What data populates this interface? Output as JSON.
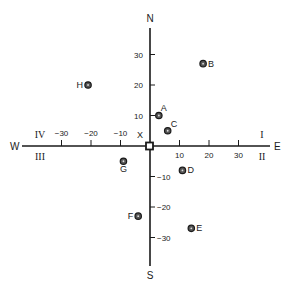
{
  "chart_data": {
    "type": "scatter",
    "title": "",
    "xlabel": "",
    "ylabel": "",
    "xlim": [
      -40,
      40
    ],
    "ylim": [
      -40,
      40
    ],
    "grid": false,
    "origin_label": "X",
    "directions": {
      "north": "N",
      "south": "S",
      "east": "E",
      "west": "W"
    },
    "quadrants": [
      {
        "label": "I",
        "position": "upper-right"
      },
      {
        "label": "II",
        "position": "lower-right"
      },
      {
        "label": "III",
        "position": "lower-left"
      },
      {
        "label": "IV",
        "position": "upper-left"
      }
    ],
    "x_ticks": [
      -30,
      -20,
      -10,
      10,
      20,
      30
    ],
    "y_ticks": [
      30,
      20,
      10,
      -10,
      -20,
      -30
    ],
    "x_tick_labels": [
      "−30",
      "−20",
      "−10",
      "10",
      "20",
      "30"
    ],
    "y_tick_labels": [
      "30",
      "20",
      "10",
      "−10",
      "−20",
      "−30"
    ],
    "points": [
      {
        "label": "A",
        "x": 3,
        "y": 10
      },
      {
        "label": "B",
        "x": 18,
        "y": 27
      },
      {
        "label": "C",
        "x": 6,
        "y": 5
      },
      {
        "label": "D",
        "x": 11,
        "y": -8
      },
      {
        "label": "E",
        "x": 14,
        "y": -27
      },
      {
        "label": "F",
        "x": -4,
        "y": -23
      },
      {
        "label": "G",
        "x": -9,
        "y": -5
      },
      {
        "label": "H",
        "x": -21,
        "y": 20
      }
    ]
  },
  "colors": {
    "ink": "#1a1a1a",
    "point_fill": "#555555",
    "background": "#ffffff"
  }
}
